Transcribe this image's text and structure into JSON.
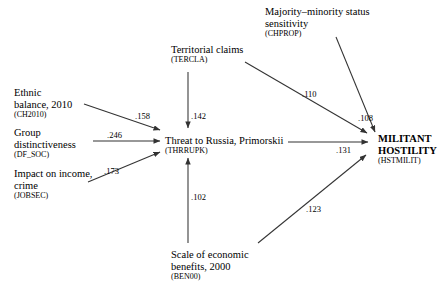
{
  "diagram": {
    "type": "path-diagram",
    "nodes": [
      {
        "id": "CH2010",
        "title_line1": "Ethnic",
        "title_line2": "balance, 2010",
        "code": "(CH2010)"
      },
      {
        "id": "DF_SOC",
        "title_line1": "Group",
        "title_line2": "distinctiveness",
        "code": "(DF_SOC)"
      },
      {
        "id": "JOBSEC",
        "title_line1": "Impact on income,",
        "title_line2": "crime",
        "code": "(JOBSEC)"
      },
      {
        "id": "TERCLA",
        "title_line1": "Territorial claims",
        "title_line2": "",
        "code": "(TERCLA)"
      },
      {
        "id": "CHPROP",
        "title_line1": "Majority–minority status",
        "title_line2": "sensitivity",
        "code": "(CHPROP)"
      },
      {
        "id": "THRRUPK",
        "title_line1": "Threat to Russia, Primorskii",
        "title_line2": "",
        "code": "(THRRUPK)"
      },
      {
        "id": "BEN00",
        "title_line1": "Scale of economic",
        "title_line2": "benefits, 2000",
        "code": "(BEN00)"
      },
      {
        "id": "HSTMILIT",
        "title_line1": "MILITANT",
        "title_line2": "HOSTILITY",
        "code": "(HSTMILIT)"
      }
    ],
    "edges": [
      {
        "from": "CH2010",
        "to": "THRRUPK",
        "coefficient": ".158"
      },
      {
        "from": "DF_SOC",
        "to": "THRRUPK",
        "coefficient": ".246"
      },
      {
        "from": "JOBSEC",
        "to": "THRRUPK",
        "coefficient": ".173"
      },
      {
        "from": "TERCLA",
        "to": "THRRUPK",
        "coefficient": ".142"
      },
      {
        "from": "BEN00",
        "to": "THRRUPK",
        "coefficient": ".102"
      },
      {
        "from": "TERCLA",
        "to": "HSTMILIT",
        "coefficient": ".110"
      },
      {
        "from": "CHPROP",
        "to": "HSTMILIT",
        "coefficient": ".108"
      },
      {
        "from": "THRRUPK",
        "to": "HSTMILIT",
        "coefficient": ".131"
      },
      {
        "from": "BEN00",
        "to": "HSTMILIT",
        "coefficient": ".123"
      }
    ],
    "colors": {
      "line": "#333333",
      "text": "#000000",
      "background": "#ffffff"
    },
    "caption": ""
  }
}
